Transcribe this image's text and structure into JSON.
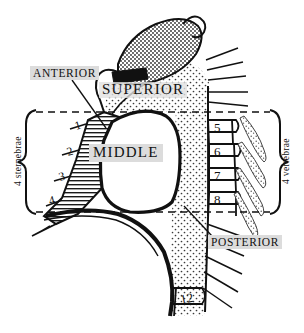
{
  "figure": {
    "background_color": "#ffffff",
    "ink_color": "#111111",
    "highlight_color": "#dcdcdc",
    "width": 304,
    "height": 333
  },
  "region_labels": {
    "anterior": "ANTERIOR",
    "superior": "SUPERIOR",
    "middle": "MIDDLE",
    "posterior": "POSTERIOR"
  },
  "brackets": {
    "left": {
      "label": "4 sternebrae",
      "side": "left",
      "count": 4
    },
    "right": {
      "label": "4 vertebrae",
      "side": "right",
      "count": 4
    }
  },
  "sternebrae": {
    "label": "4 sternebrae",
    "numbers": [
      "1",
      "2",
      "3",
      "4"
    ],
    "positions": [
      {
        "value": "1",
        "x": 76,
        "y": 130
      },
      {
        "value": "2",
        "x": 68,
        "y": 155
      },
      {
        "value": "3",
        "x": 61,
        "y": 180
      },
      {
        "value": "4",
        "x": 52,
        "y": 203
      }
    ]
  },
  "vertebrae": {
    "label": "4 vertebrae",
    "numbers": [
      "5",
      "6",
      "7",
      "8",
      "12"
    ],
    "positions": [
      {
        "value": "5",
        "x": 214,
        "y": 132
      },
      {
        "value": "6",
        "x": 214,
        "y": 157
      },
      {
        "value": "7",
        "x": 214,
        "y": 181
      },
      {
        "value": "8",
        "x": 214,
        "y": 205
      },
      {
        "value": "12",
        "x": 185,
        "y": 305
      }
    ]
  },
  "boundary": {
    "type": "dashed-rectangle",
    "description": "dashed horizontal planes bounding the inferior mediastinum",
    "top_y": 112,
    "bottom_y": 212,
    "left_x": 36,
    "right_x": 270
  },
  "textures": {
    "posterior_fill": "dot-stipple",
    "superior_fill": "dot-stipple",
    "sternum_fill": "horizontal-hatch",
    "rib_fill": "speckle",
    "manubrium_fill": "dot-stipple",
    "clavicle_notch_fill": "solid-black"
  }
}
